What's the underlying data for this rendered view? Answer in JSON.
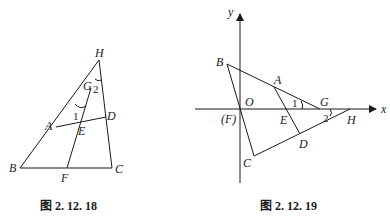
{
  "figures": [
    {
      "caption": "图 2. 12. 18",
      "labels": {
        "H": "H",
        "G": "G",
        "A": "A",
        "D": "D",
        "E": "E",
        "B": "B",
        "C": "C",
        "F": "F",
        "angle1": "1",
        "angle2": "2"
      }
    },
    {
      "caption": "图 2. 12. 19",
      "labels": {
        "y": "y",
        "x": "x",
        "B": "B",
        "A": "A",
        "O": "O",
        "F": "(F)",
        "E": "E",
        "G": "G",
        "H": "H",
        "D": "D",
        "C": "C",
        "angle1": "1",
        "angle2": "2"
      }
    }
  ],
  "colors": {
    "stroke": "#1a1a1a",
    "background": "#ffffff"
  }
}
